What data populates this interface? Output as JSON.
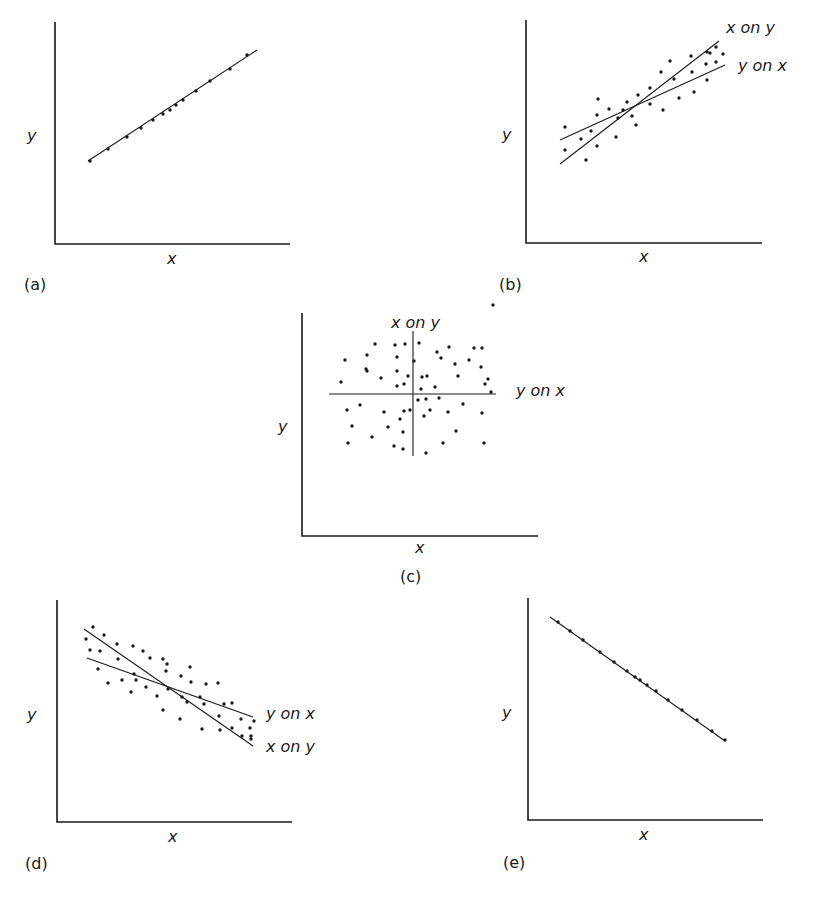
{
  "chart_data": [
    {
      "id": "a",
      "type": "scatter",
      "panel_label": "(a)",
      "xlabel": "x",
      "ylabel": "y",
      "description": "Perfect positive correlation; regression lines coincide",
      "axes": {
        "origin": [
          55,
          244
        ],
        "x_end": 290,
        "y_end": 22
      },
      "lines": [
        {
          "name": "",
          "from": [
            88,
            161
          ],
          "to": [
            257,
            50
          ]
        }
      ],
      "points": [
        [
          90,
          161
        ],
        [
          108,
          149
        ],
        [
          127,
          137
        ],
        [
          141,
          128
        ],
        [
          153,
          120
        ],
        [
          163,
          114
        ],
        [
          170,
          110
        ],
        [
          176,
          105
        ],
        [
          183,
          100
        ],
        [
          196,
          91
        ],
        [
          210,
          81
        ],
        [
          230,
          69
        ],
        [
          247,
          55
        ]
      ]
    },
    {
      "id": "b",
      "type": "scatter",
      "panel_label": "(b)",
      "xlabel": "x",
      "ylabel": "y",
      "description": "Positive correlation; two distinct regression lines",
      "axes": {
        "origin": [
          526,
          243
        ],
        "x_end": 762,
        "y_end": 20
      },
      "lines": [
        {
          "name": "x on y",
          "from": [
            560,
            164
          ],
          "to": [
            719,
            41
          ],
          "label_pos": [
            726,
            33
          ]
        },
        {
          "name": "y on x",
          "from": [
            560,
            140
          ],
          "to": [
            725,
            65
          ],
          "label_pos": [
            738,
            71
          ]
        }
      ],
      "points": [
        [
          565,
          127
        ],
        [
          565,
          150
        ],
        [
          581,
          139
        ],
        [
          586,
          160
        ],
        [
          591,
          131
        ],
        [
          597,
          115
        ],
        [
          597,
          146
        ],
        [
          598,
          99
        ],
        [
          609,
          109
        ],
        [
          616,
          137
        ],
        [
          618,
          118
        ],
        [
          623,
          110
        ],
        [
          627,
          102
        ],
        [
          632,
          116
        ],
        [
          636,
          125
        ],
        [
          638,
          95
        ],
        [
          650,
          104
        ],
        [
          650,
          88
        ],
        [
          661,
          72
        ],
        [
          663,
          110
        ],
        [
          670,
          61
        ],
        [
          674,
          79
        ],
        [
          679,
          98
        ],
        [
          691,
          56
        ],
        [
          692,
          72
        ],
        [
          694,
          92
        ],
        [
          706,
          64
        ],
        [
          707,
          52
        ],
        [
          707,
          80
        ],
        [
          710,
          53
        ],
        [
          716,
          47
        ],
        [
          716,
          62
        ],
        [
          723,
          54
        ]
      ]
    },
    {
      "id": "c",
      "type": "scatter",
      "panel_label": "(c)",
      "xlabel": "x",
      "ylabel": "y",
      "description": "Zero correlation; regression lines perpendicular",
      "axes": {
        "origin": [
          302,
          536
        ],
        "x_end": 538,
        "y_end": 313
      },
      "lines": [
        {
          "name": "x on y",
          "from": [
            413,
            331
          ],
          "to": [
            413,
            456
          ],
          "label_pos": [
            391,
            328
          ]
        },
        {
          "name": "y on x",
          "from": [
            329,
            394
          ],
          "to": [
            496,
            394
          ],
          "label_pos": [
            516,
            396
          ]
        }
      ],
      "points": [
        [
          345,
          360
        ],
        [
          341,
          382
        ],
        [
          347,
          410
        ],
        [
          352,
          426
        ],
        [
          348,
          443
        ],
        [
          360,
          405
        ],
        [
          367,
          371
        ],
        [
          367,
          355
        ],
        [
          366,
          369
        ],
        [
          372,
          437
        ],
        [
          375,
          344
        ],
        [
          381,
          378
        ],
        [
          384,
          412
        ],
        [
          388,
          427
        ],
        [
          394,
          446
        ],
        [
          395,
          345
        ],
        [
          397,
          357
        ],
        [
          397,
          371
        ],
        [
          397,
          386
        ],
        [
          400,
          419
        ],
        [
          403,
          432
        ],
        [
          403,
          449
        ],
        [
          404,
          384
        ],
        [
          404,
          411
        ],
        [
          405,
          344
        ],
        [
          408,
          376
        ],
        [
          410,
          410
        ],
        [
          414,
          361
        ],
        [
          418,
          400
        ],
        [
          419,
          343
        ],
        [
          422,
          377
        ],
        [
          421,
          389
        ],
        [
          424,
          416
        ],
        [
          426,
          399
        ],
        [
          426,
          453
        ],
        [
          427,
          376
        ],
        [
          430,
          410
        ],
        [
          435,
          387
        ],
        [
          437,
          352
        ],
        [
          439,
          398
        ],
        [
          441,
          358
        ],
        [
          443,
          443
        ],
        [
          448,
          412
        ],
        [
          449,
          347
        ],
        [
          455,
          364
        ],
        [
          456,
          431
        ],
        [
          458,
          376
        ],
        [
          463,
          404
        ],
        [
          469,
          360
        ],
        [
          474,
          348
        ],
        [
          482,
          413
        ],
        [
          481,
          367
        ],
        [
          482,
          348
        ],
        [
          484,
          443
        ],
        [
          485,
          384
        ],
        [
          491,
          392
        ],
        [
          488,
          379
        ],
        [
          493,
          305
        ]
      ]
    },
    {
      "id": "d",
      "type": "scatter",
      "panel_label": "(d)",
      "xlabel": "x",
      "ylabel": "y",
      "description": "Negative correlation; two distinct regression lines",
      "axes": {
        "origin": [
          57,
          822
        ],
        "x_end": 292,
        "y_end": 600
      },
      "lines": [
        {
          "name": "y on x",
          "from": [
            87,
            658
          ],
          "to": [
            253,
            717
          ],
          "label_pos": [
            266,
            719
          ]
        },
        {
          "name": "x on y",
          "from": [
            84,
            629
          ],
          "to": [
            253,
            746
          ],
          "label_pos": [
            266,
            752
          ]
        }
      ],
      "points": [
        [
          86,
          639
        ],
        [
          93,
          627
        ],
        [
          90,
          650
        ],
        [
          100,
          651
        ],
        [
          98,
          669
        ],
        [
          104,
          635
        ],
        [
          108,
          683
        ],
        [
          117,
          644
        ],
        [
          118,
          659
        ],
        [
          122,
          680
        ],
        [
          131,
          692
        ],
        [
          133,
          646
        ],
        [
          134,
          674
        ],
        [
          136,
          680
        ],
        [
          143,
          651
        ],
        [
          146,
          687
        ],
        [
          150,
          658
        ],
        [
          157,
          696
        ],
        [
          163,
          659
        ],
        [
          163,
          710
        ],
        [
          166,
          671
        ],
        [
          168,
          689
        ],
        [
          167,
          664
        ],
        [
          181,
          676
        ],
        [
          180,
          719
        ],
        [
          182,
          697
        ],
        [
          187,
          702
        ],
        [
          190,
          667
        ],
        [
          191,
          682
        ],
        [
          200,
          697
        ],
        [
          204,
          704
        ],
        [
          202,
          729
        ],
        [
          206,
          684
        ],
        [
          218,
          683
        ],
        [
          219,
          716
        ],
        [
          220,
          730
        ],
        [
          224,
          704
        ],
        [
          232,
          703
        ],
        [
          232,
          728
        ],
        [
          241,
          719
        ],
        [
          242,
          736
        ],
        [
          250,
          728
        ],
        [
          251,
          739
        ],
        [
          251,
          736
        ],
        [
          254,
          721
        ]
      ]
    },
    {
      "id": "e",
      "type": "scatter",
      "panel_label": "(e)",
      "xlabel": "x",
      "ylabel": "y",
      "description": "Perfect negative correlation; regression lines coincide",
      "axes": {
        "origin": [
          528,
          820
        ],
        "x_end": 763,
        "y_end": 598
      },
      "lines": [
        {
          "name": "",
          "from": [
            550,
            617
          ],
          "to": [
            725,
            741
          ]
        }
      ],
      "points": [
        [
          558,
          622
        ],
        [
          570,
          631
        ],
        [
          583,
          640
        ],
        [
          600,
          652
        ],
        [
          614,
          662
        ],
        [
          627,
          671
        ],
        [
          635,
          677
        ],
        [
          640,
          680
        ],
        [
          647,
          685
        ],
        [
          656,
          691
        ],
        [
          668,
          700
        ],
        [
          682,
          710
        ],
        [
          697,
          720
        ],
        [
          712,
          731
        ],
        [
          725,
          740
        ]
      ]
    }
  ],
  "labels": {
    "a": {
      "panel": "(a)",
      "x": "x",
      "y": "y"
    },
    "b": {
      "panel": "(b)",
      "x": "x",
      "y": "y",
      "line1": "x on y",
      "line2": "y on x"
    },
    "c": {
      "panel": "(c)",
      "x": "x",
      "y": "y",
      "line1": "x on y",
      "line2": "y on x"
    },
    "d": {
      "panel": "(d)",
      "x": "x",
      "y": "y",
      "line1": "y on x",
      "line2": "x on y"
    },
    "e": {
      "panel": "(e)",
      "x": "x",
      "y": "y"
    }
  },
  "style": {
    "ink": "#1a1a1a",
    "background": "#ffffff"
  }
}
